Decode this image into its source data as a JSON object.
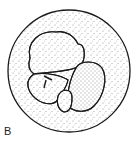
{
  "figure": {
    "label": "B",
    "colors": {
      "line": "#1a1a1a",
      "background": "#ffffff",
      "stipple": "#333333"
    }
  }
}
